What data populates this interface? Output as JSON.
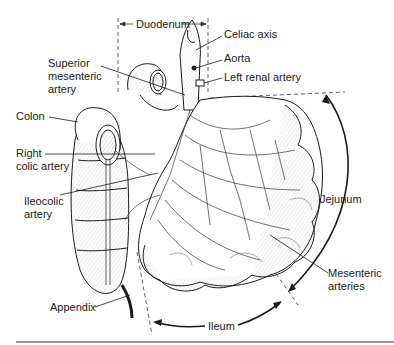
{
  "labels": {
    "duodenum": "Duodenum",
    "celiac_axis": "Celiac axis",
    "aorta": "Aorta",
    "left_renal_artery": "Left renal artery",
    "superior_mesenteric_artery": "Superior\nmesenteric\nartery",
    "colon": "Colon",
    "right_colic_artery": "Right\ncolic artery",
    "ileocolic_artery": "Ileocolic\nartery",
    "jejunum": "Jejunum",
    "mesenteric_arteries": "Mesenteric\narteries",
    "appendix": "Appendix",
    "ileum": "Ileum"
  },
  "colors": {
    "ink": "#1a1a1a",
    "shade": "#8a8a8a",
    "rule": "#7a7a7a",
    "background": "#ffffff"
  }
}
